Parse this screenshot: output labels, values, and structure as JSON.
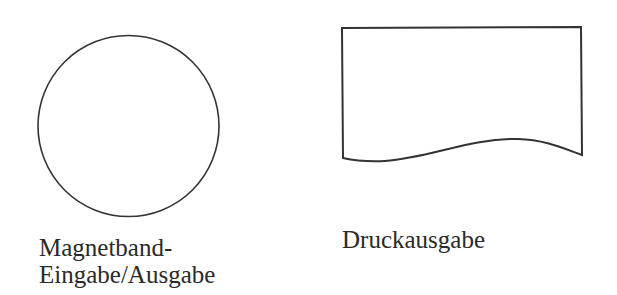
{
  "symbols": [
    {
      "shape": "circle",
      "label_lines": [
        "Magnetband-",
        "Eingabe/Ausgabe"
      ]
    },
    {
      "shape": "document",
      "label_lines": [
        "Druckausgabe"
      ]
    }
  ],
  "colors": {
    "stroke": "#333333",
    "background": "#ffffff"
  }
}
